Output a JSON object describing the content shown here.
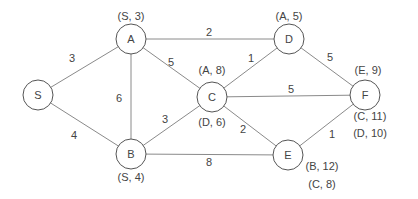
{
  "diagram": {
    "type": "weighted-undirected-graph",
    "nodes": [
      {
        "id": "S",
        "label": "S",
        "x": 38,
        "y": 95
      },
      {
        "id": "A",
        "label": "A",
        "x": 131,
        "y": 39
      },
      {
        "id": "B",
        "label": "B",
        "x": 131,
        "y": 154
      },
      {
        "id": "C",
        "label": "C",
        "x": 212,
        "y": 97
      },
      {
        "id": "D",
        "label": "D",
        "x": 289,
        "y": 39
      },
      {
        "id": "E",
        "label": "E",
        "x": 288,
        "y": 155
      },
      {
        "id": "F",
        "label": "F",
        "x": 365,
        "y": 95
      }
    ],
    "edges": [
      {
        "from": "S",
        "to": "A",
        "weight": "3",
        "lx": 72,
        "ly": 58
      },
      {
        "from": "S",
        "to": "B",
        "weight": "4",
        "lx": 74,
        "ly": 135
      },
      {
        "from": "A",
        "to": "B",
        "weight": "6",
        "lx": 119,
        "ly": 98
      },
      {
        "from": "A",
        "to": "C",
        "weight": "5",
        "lx": 171,
        "ly": 62
      },
      {
        "from": "A",
        "to": "D",
        "weight": "2",
        "lx": 209,
        "ly": 32
      },
      {
        "from": "B",
        "to": "C",
        "weight": "3",
        "lx": 165,
        "ly": 119
      },
      {
        "from": "B",
        "to": "E",
        "weight": "8",
        "lx": 209,
        "ly": 162
      },
      {
        "from": "C",
        "to": "D",
        "weight": "1",
        "lx": 251,
        "ly": 58
      },
      {
        "from": "C",
        "to": "F",
        "weight": "5",
        "lx": 291,
        "ly": 89
      },
      {
        "from": "C",
        "to": "E",
        "weight": "2",
        "lx": 243,
        "ly": 129
      },
      {
        "from": "D",
        "to": "F",
        "weight": "5",
        "lx": 330,
        "ly": 57
      },
      {
        "from": "E",
        "to": "F",
        "weight": "1",
        "lx": 332,
        "ly": 134
      }
    ],
    "annotations": [
      {
        "node": "A",
        "text": "(S, 3)",
        "x": 131,
        "y": 16
      },
      {
        "node": "B",
        "text": "(S, 4)",
        "x": 131,
        "y": 177
      },
      {
        "node": "C",
        "text": "(A, 8)",
        "x": 212,
        "y": 70
      },
      {
        "node": "C",
        "text": "(D, 6)",
        "x": 212,
        "y": 122
      },
      {
        "node": "D",
        "text": "(A, 5)",
        "x": 289,
        "y": 16
      },
      {
        "node": "E",
        "text": "(B, 12)",
        "x": 322,
        "y": 166
      },
      {
        "node": "E",
        "text": "(C, 8)",
        "x": 322,
        "y": 184
      },
      {
        "node": "F",
        "text": "(E, 9)",
        "x": 368,
        "y": 70
      },
      {
        "node": "F",
        "text": "(C, 11)",
        "x": 370,
        "y": 116
      },
      {
        "node": "F",
        "text": "(D, 10)",
        "x": 370,
        "y": 133
      }
    ],
    "node_radius": 15,
    "colors": {
      "edge": "#8a8a8a",
      "node_stroke": "#555555",
      "text": "#444444",
      "background": "#ffffff"
    }
  }
}
